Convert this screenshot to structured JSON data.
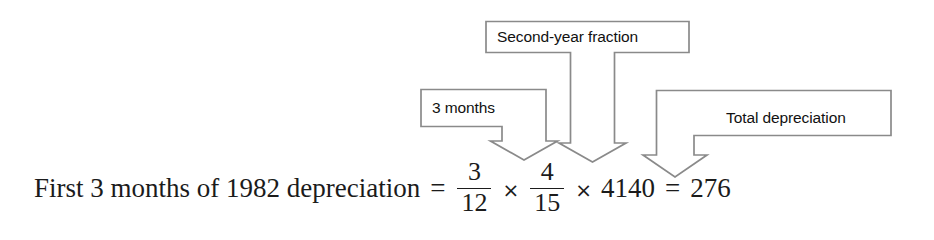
{
  "figure": {
    "background_color": "#ffffff",
    "line_color": "#808080",
    "text_color": "#1b1b1b"
  },
  "callouts": [
    {
      "id": "second-year-fraction",
      "label": "Second-year fraction",
      "points_to": "4/15",
      "arrow_direction": "down"
    },
    {
      "id": "three-months",
      "label": "3 months",
      "points_to": "3/12",
      "arrow_direction": "down"
    },
    {
      "id": "total-depreciation",
      "label": "Total depreciation",
      "points_to": "4140",
      "arrow_direction": "down"
    }
  ],
  "equation": {
    "lead_text": "First 3 months of 1982 depreciation",
    "equals_1": "=",
    "fraction_1": {
      "numerator": "3",
      "denominator": "12"
    },
    "times_1": "×",
    "fraction_2": {
      "numerator": "4",
      "denominator": "15"
    },
    "times_2": "×",
    "factor": "4140",
    "equals_2": "=",
    "result": "276"
  }
}
